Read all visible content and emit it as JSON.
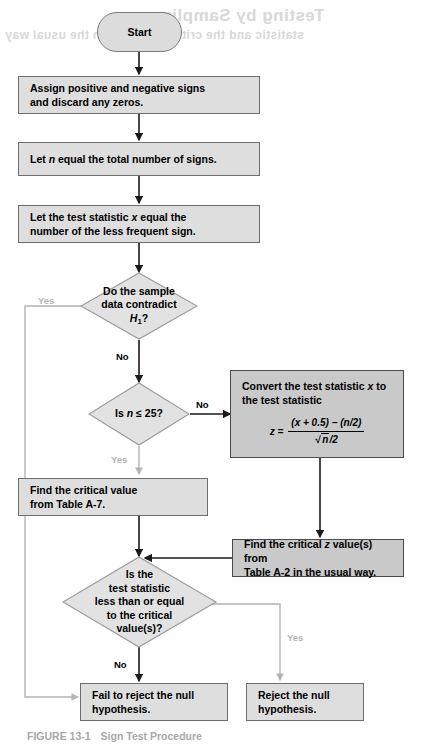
{
  "figure": {
    "caption_label": "FIGURE 13-1",
    "caption_title": "Sign Test Procedure",
    "ghost_text_1": "Testing by Sampling",
    "ghost_text_2": "statistic and the critical value(s) in the usual way"
  },
  "colors": {
    "shape_fill": "#dedede",
    "shaded_fill": "#c9c9c9",
    "shape_border": "#6e6e6e",
    "shaded_border": "#4a4a4a",
    "line": "#1a1a1a",
    "faint_line": "#b4b4b4",
    "text": "#000000"
  },
  "nodes": {
    "start": {
      "label": "Start",
      "type": "terminator"
    },
    "assign_signs": {
      "label": "Assign positive and negative signs and discard any zeros.",
      "type": "process"
    },
    "let_n": {
      "label": "Let n equal the total number of signs.",
      "type": "process"
    },
    "let_x": {
      "label": "Let the test statistic x equal the number of the less frequent sign.",
      "type": "process"
    },
    "contradict": {
      "label": "Do the sample data contradict H1?",
      "type": "decision"
    },
    "is_n_le_25": {
      "label": "Is n ≤ 25?",
      "type": "decision"
    },
    "convert": {
      "label": "Convert the test statistic x to the test statistic",
      "type": "process-shaded"
    },
    "find_crit_a7": {
      "label": "Find the critical value from Table A-7.",
      "type": "process"
    },
    "find_crit_a2": {
      "label": "Find the critical z value(s) from Table A-2 in the usual way.",
      "type": "process-shaded"
    },
    "compare": {
      "label": "Is the test statistic less than or equal to the critical value(s)?",
      "type": "decision"
    },
    "fail_reject": {
      "label": "Fail to reject the null hypothesis.",
      "type": "process"
    },
    "reject": {
      "label": "Reject the null hypothesis.",
      "type": "process"
    }
  },
  "formula": {
    "lhs": "z =",
    "numerator": "(x + 0.5) − (n/2)",
    "denominator_radicand": "n",
    "denominator_suffix": "/2"
  },
  "edge_labels": {
    "contradict_yes": "Yes",
    "contradict_no": "No",
    "n25_no": "No",
    "n25_yes": "Yes",
    "compare_no": "No",
    "compare_yes": "Yes"
  }
}
